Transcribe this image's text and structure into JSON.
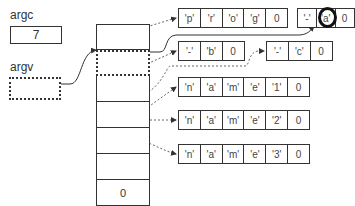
{
  "argc": {
    "label": "argc",
    "value": "7"
  },
  "argv": {
    "label": "argv"
  },
  "pointer_array": {
    "cells": [
      "",
      "",
      "",
      "",
      "",
      "",
      "0"
    ],
    "highlighted_cell_index": 1
  },
  "strings": [
    {
      "id": "prog",
      "chars": [
        "'p'",
        "'r'",
        "'o'",
        "'g'",
        "0"
      ]
    },
    {
      "id": "opt_a",
      "chars": [
        "'-'",
        "'a'",
        "0"
      ],
      "circled_index": 1
    },
    {
      "id": "opt_b",
      "chars": [
        "'-'",
        "'b'",
        "0"
      ]
    },
    {
      "id": "opt_c",
      "chars": [
        "'-'",
        "'c'",
        "0"
      ]
    },
    {
      "id": "name1",
      "chars": [
        "'n'",
        "'a'",
        "'m'",
        "'e'",
        "'1'",
        "0"
      ]
    },
    {
      "id": "name2",
      "chars": [
        "'n'",
        "'a'",
        "'m'",
        "'e'",
        "'2'",
        "0"
      ]
    },
    {
      "id": "name3",
      "chars": [
        "'n'",
        "'a'",
        "'m'",
        "'e'",
        "'3'",
        "0"
      ]
    }
  ]
}
